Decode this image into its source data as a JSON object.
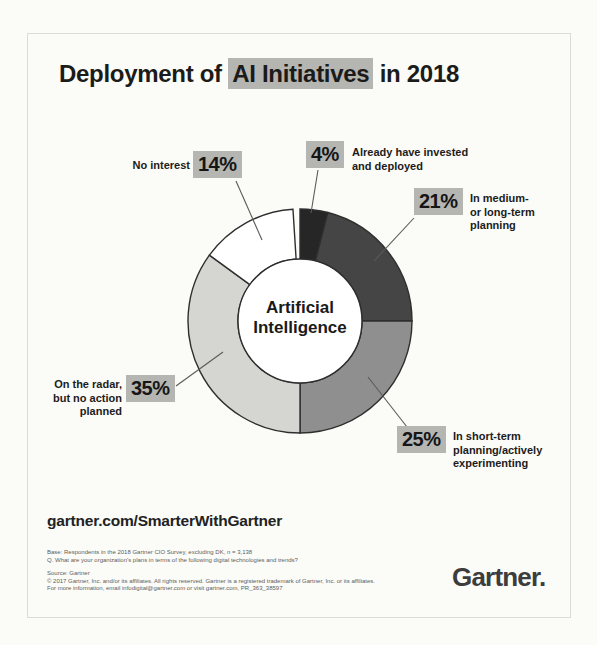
{
  "page": {
    "highlight_color": "#b5b5b2",
    "border_color": "#dcdcd4"
  },
  "title": {
    "prefix": "Deployment of ",
    "highlight": "AI Initiatives",
    "suffix": " in 2018"
  },
  "chart_data": {
    "type": "pie",
    "subtype": "donut",
    "title": "Deployment of AI Initiatives in 2018",
    "center_label": "Artificial\nIntelligence",
    "start_angle_deg": 0,
    "direction": "clockwise",
    "outline_color": "#2e2e2e",
    "segments": [
      {
        "label": "Already have invested and deployed",
        "value": 4,
        "pct": "4%",
        "color": "#262626"
      },
      {
        "label": "In medium- or long-term planning",
        "value": 21,
        "pct": "21%",
        "color": "#454545"
      },
      {
        "label": "In short-term planning/actively experimenting",
        "value": 25,
        "pct": "25%",
        "color": "#8f8f8f"
      },
      {
        "label": "On the radar, but no action planned",
        "value": 35,
        "pct": "35%",
        "color": "#d5d5d1"
      },
      {
        "label": "No interest",
        "value": 14,
        "pct": "14%",
        "color": "#ffffff"
      }
    ]
  },
  "callouts": {
    "deployed": {
      "text": "Already have invested\nand deployed"
    },
    "medium_term": {
      "text": "In medium-\nor long-term\nplanning"
    },
    "short_term": {
      "text": "In short-term\nplanning/actively\nexperimenting"
    },
    "radar": {
      "text": "On the radar,\nbut no action\nplanned"
    },
    "no_interest": {
      "text": "No interest"
    }
  },
  "footer": {
    "url": "gartner.com/SmarterWithGartner",
    "base_note": "Base: Respondents in the 2018 Gartner CIO Survey, excluding DK, n = 3,138\nQ. What are your organization's plans in terms of the following digital technologies and trends?",
    "source_note": "Source: Gartner\n© 2017 Gartner, Inc. and/or its affiliates. All rights reserved. Gartner is a registered trademark of Gartner, Inc. or its affiliates.\nFor more information, email infodigital@gartner.com or visit gartner.com, PR_363_38597",
    "logo": "Gartner."
  }
}
